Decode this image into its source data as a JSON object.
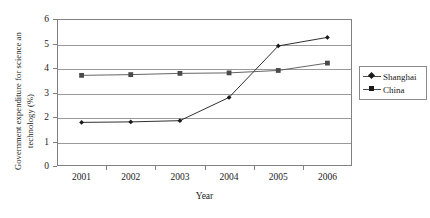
{
  "chart_data": {
    "type": "line",
    "title": "",
    "xlabel": "Year",
    "ylabel_line1": "Government expenditure for science an",
    "ylabel_line2": "technology (%)",
    "categories": [
      "2001",
      "2002",
      "2003",
      "2004",
      "2005",
      "2006"
    ],
    "xticks": [
      "2001",
      "2002",
      "2003",
      "2004",
      "2005",
      "2006"
    ],
    "yticks": [
      "0",
      "1",
      "2",
      "3",
      "4",
      "5",
      "6"
    ],
    "ylim": [
      0,
      6
    ],
    "grid": "horizontal",
    "legend_position": "right",
    "series": [
      {
        "name": "Shanghai",
        "marker": "diamond",
        "color": "#1a1a1a",
        "values": [
          1.78,
          1.8,
          1.85,
          2.8,
          4.9,
          5.25
        ]
      },
      {
        "name": "China",
        "marker": "square",
        "color": "#555555",
        "values": [
          3.7,
          3.73,
          3.78,
          3.8,
          3.9,
          4.2
        ]
      }
    ]
  }
}
